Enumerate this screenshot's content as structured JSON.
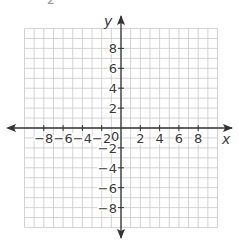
{
  "figure": {
    "top_fragment": "2",
    "x_axis_label": "x",
    "y_axis_label": "y",
    "origin_label": "0",
    "x_tick_labels": [
      "−8",
      "−6",
      "−4",
      "−2",
      "2",
      "4",
      "6",
      "8"
    ],
    "x_tick_values": [
      -8,
      -6,
      -4,
      -2,
      2,
      4,
      6,
      8
    ],
    "y_tick_labels": [
      "8",
      "6",
      "4",
      "2",
      "−2",
      "−4",
      "−6",
      "−8"
    ],
    "y_tick_values": [
      8,
      6,
      4,
      2,
      -2,
      -4,
      -6,
      -8
    ],
    "grid_range": {
      "xmin": -10,
      "xmax": 10,
      "ymin": -10,
      "ymax": 10
    },
    "colors": {
      "grid": "#c8c8c8",
      "axis": "#333333",
      "text": "#3a3a3a"
    }
  }
}
